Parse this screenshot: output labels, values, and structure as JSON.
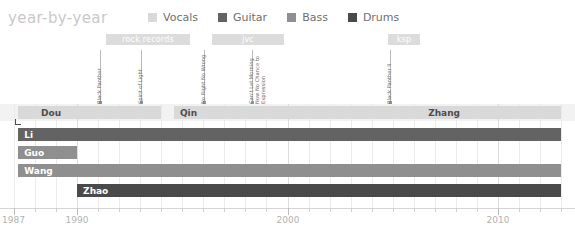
{
  "header": {
    "title": "year-by-year"
  },
  "legend": {
    "items": [
      {
        "label": "Vocals",
        "color": "#d9d9d9"
      },
      {
        "label": "Guitar",
        "color": "#636363"
      },
      {
        "label": "Bass",
        "color": "#8f8f8f"
      },
      {
        "label": "Drums",
        "color": "#4a4a4a"
      }
    ]
  },
  "label_bands": [
    {
      "name": "rock records",
      "x": 106,
      "w": 84,
      "color": "#dcdcdc"
    },
    {
      "name": "jvc",
      "x": 212,
      "w": 72,
      "color": "#dcdcdc"
    },
    {
      "name": "ksp",
      "x": 388,
      "w": 32,
      "color": "#dcdcdc"
    }
  ],
  "annotations": [
    {
      "lines": [
        "Black Panther"
      ],
      "x": 100
    },
    {
      "lines": [
        "Spirit of Light"
      ],
      "x": 141
    },
    {
      "lines": [
        "No Right No Wrong"
      ],
      "x": 204
    },
    {
      "lines": [
        "Can't Let Morning",
        "Now No Chance to",
        "Expression"
      ],
      "x": 252
    },
    {
      "lines": [
        "Black Panther II"
      ],
      "x": 390
    }
  ],
  "chart_data": {
    "type": "bar",
    "title": "year-by-year",
    "xlabel": "",
    "ylabel": "",
    "xlim": [
      1987,
      2013
    ],
    "grid": true,
    "legend_position": "top-right",
    "axis_ticks": [
      {
        "label": "1987",
        "year": 1987,
        "major": true
      },
      {
        "label": "1990",
        "year": 1990,
        "major": true
      },
      {
        "label": "2000",
        "year": 2000,
        "major": true
      },
      {
        "label": "2010",
        "year": 2010,
        "major": true
      }
    ],
    "rows": [
      {
        "row": 0,
        "role": "Vocals",
        "color": "#d9d9d9",
        "bars": [
          {
            "name": "Ding",
            "start": 1987.2,
            "end": 1988.0,
            "label_outside": true,
            "text_color": "dark"
          },
          {
            "name": "Dou",
            "start": 1988.0,
            "end": 1994.0,
            "label_outside": false,
            "text_color": "dark"
          },
          {
            "name": "Qin",
            "start": 1994.6,
            "end": 2006.4,
            "label_outside": false,
            "text_color": "dark"
          },
          {
            "name": "Zhang",
            "start": 2006.4,
            "end": 2013.0,
            "label_outside": false,
            "text_color": "dark"
          }
        ]
      },
      {
        "row": 1,
        "role": "Guitar",
        "color": "#636363",
        "bars": [
          {
            "name": "Li",
            "start": 1987.2,
            "end": 2013.0,
            "label_outside": false,
            "text_color": "light"
          }
        ]
      },
      {
        "row": 2,
        "role": "Bass",
        "color": "#8f8f8f",
        "bars": [
          {
            "name": "Guo",
            "start": 1987.2,
            "end": 1990.0,
            "label_outside": false,
            "text_color": "light"
          }
        ]
      },
      {
        "row": 3,
        "role": "Bass",
        "color": "#8f8f8f",
        "bars": [
          {
            "name": "Wang",
            "start": 1987.2,
            "end": 2013.0,
            "label_outside": false,
            "text_color": "light"
          }
        ]
      },
      {
        "row": 4,
        "role": "Drums",
        "color": "#4a4a4a",
        "bars": [
          {
            "name": "Zhao",
            "start": 1990.0,
            "end": 2013.0,
            "label_outside": false,
            "text_color": "light"
          }
        ]
      }
    ]
  }
}
